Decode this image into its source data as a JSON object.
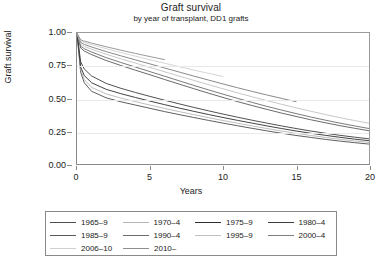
{
  "chart_data": {
    "type": "line",
    "title": "Graft survival",
    "subtitle": "by year of transplant, DD1 grafts",
    "xlabel": "Years",
    "ylabel": "Graft survival",
    "xlim": [
      0,
      20
    ],
    "ylim": [
      0,
      1
    ],
    "xticks": [
      0,
      5,
      10,
      15,
      20
    ],
    "xtick_labels": [
      "0",
      "5",
      "10",
      "15",
      "20"
    ],
    "yticks": [
      0.0,
      0.25,
      0.5,
      0.75,
      1.0
    ],
    "ytick_labels": [
      "0.00",
      "0.25",
      "0.50",
      "0.75",
      "1.00"
    ],
    "grid": "horizontal",
    "legend_position": "below",
    "series": [
      {
        "name": "1965–9",
        "color": "#4d4d4d",
        "x": [
          0,
          0.25,
          0.5,
          1,
          2,
          3,
          4,
          5,
          6,
          7,
          8,
          9,
          10,
          11,
          12,
          13,
          14,
          15,
          16,
          17,
          18,
          19,
          20
        ],
        "y": [
          1.0,
          0.7,
          0.62,
          0.555,
          0.505,
          0.475,
          0.45,
          0.425,
          0.4,
          0.377,
          0.355,
          0.333,
          0.312,
          0.292,
          0.272,
          0.253,
          0.235,
          0.218,
          0.203,
          0.188,
          0.175,
          0.163,
          0.152
        ]
      },
      {
        "name": "1970–4",
        "color": "#b5b5b5",
        "x": [
          0,
          0.25,
          0.5,
          1,
          2,
          3,
          4,
          5,
          6,
          7,
          8,
          9,
          10,
          11,
          12,
          13,
          14,
          15,
          16,
          17,
          18,
          19,
          20
        ],
        "y": [
          1.0,
          0.72,
          0.645,
          0.585,
          0.535,
          0.503,
          0.476,
          0.45,
          0.424,
          0.4,
          0.377,
          0.354,
          0.332,
          0.311,
          0.291,
          0.271,
          0.252,
          0.234,
          0.218,
          0.203,
          0.189,
          0.176,
          0.165
        ]
      },
      {
        "name": "1975–9",
        "color": "#2e2e2e",
        "x": [
          0,
          0.25,
          0.5,
          1,
          2,
          3,
          4,
          5,
          6,
          7,
          8,
          9,
          10,
          11,
          12,
          13,
          14,
          15,
          16,
          17,
          18,
          19,
          20
        ],
        "y": [
          1.0,
          0.74,
          0.675,
          0.62,
          0.57,
          0.537,
          0.508,
          0.48,
          0.453,
          0.427,
          0.402,
          0.378,
          0.355,
          0.333,
          0.312,
          0.291,
          0.271,
          0.252,
          0.235,
          0.219,
          0.204,
          0.19,
          0.178
        ]
      },
      {
        "name": "1980–4",
        "color": "#3d3d3d",
        "x": [
          0,
          0.25,
          0.5,
          1,
          2,
          3,
          4,
          5,
          6,
          7,
          8,
          9,
          10,
          11,
          12,
          13,
          14,
          15,
          16,
          17,
          18,
          19,
          20
        ],
        "y": [
          1.0,
          0.78,
          0.725,
          0.672,
          0.615,
          0.578,
          0.546,
          0.516,
          0.487,
          0.459,
          0.432,
          0.406,
          0.381,
          0.357,
          0.334,
          0.312,
          0.291,
          0.271,
          0.252,
          0.235,
          0.219,
          0.205,
          0.192
        ]
      },
      {
        "name": "1985–9",
        "color": "#595959",
        "x": [
          0,
          0.25,
          0.5,
          1,
          2,
          3,
          4,
          5,
          6,
          7,
          8,
          9,
          10,
          11,
          12,
          13,
          14,
          15,
          16,
          17,
          18,
          19,
          20
        ],
        "y": [
          1.0,
          0.885,
          0.862,
          0.835,
          0.79,
          0.752,
          0.716,
          0.681,
          0.645,
          0.61,
          0.575,
          0.541,
          0.508,
          0.476,
          0.446,
          0.417,
          0.389,
          0.363,
          0.338,
          0.315,
          0.293,
          0.273,
          0.254
        ]
      },
      {
        "name": "1990–4",
        "color": "#6b6b6b",
        "x": [
          0,
          0.25,
          0.5,
          1,
          2,
          3,
          4,
          5,
          6,
          7,
          8,
          9,
          10,
          11,
          12,
          13,
          14,
          15,
          16,
          17,
          18,
          19,
          20
        ],
        "y": [
          1.0,
          0.9,
          0.88,
          0.855,
          0.812,
          0.775,
          0.74,
          0.705,
          0.67,
          0.635,
          0.6,
          0.566,
          0.533,
          0.501,
          0.47,
          0.44,
          0.412,
          0.385,
          0.359,
          0.335,
          0.312,
          0.291,
          0.271
        ]
      },
      {
        "name": "1995–9",
        "color": "#c2c2c2",
        "x": [
          0,
          0.25,
          0.5,
          1,
          2,
          3,
          4,
          5,
          6,
          7,
          8,
          9,
          10,
          11,
          12,
          13,
          14,
          15,
          16,
          17,
          18,
          19,
          20
        ],
        "y": [
          1.0,
          0.915,
          0.898,
          0.876,
          0.838,
          0.803,
          0.77,
          0.737,
          0.704,
          0.671,
          0.638,
          0.606,
          0.574,
          0.543,
          0.513,
          0.484,
          0.456,
          0.429,
          0.403,
          0.378,
          0.354,
          0.332,
          0.311
        ]
      },
      {
        "name": "2000–4",
        "color": "#7d7d7d",
        "x": [
          0,
          0.25,
          0.5,
          1,
          2,
          3,
          4,
          5,
          6,
          7,
          8,
          9,
          10,
          11,
          12,
          13,
          14,
          15
        ],
        "y": [
          1.0,
          0.928,
          0.913,
          0.893,
          0.858,
          0.826,
          0.795,
          0.764,
          0.733,
          0.702,
          0.671,
          0.641,
          0.611,
          0.582,
          0.554,
          0.527,
          0.501,
          0.476
        ]
      },
      {
        "name": "2006–10",
        "color": "#cfcfcf",
        "x": [
          0,
          0.25,
          0.5,
          1,
          2,
          3,
          4,
          5,
          6,
          7,
          8,
          9,
          10
        ],
        "y": [
          1.0,
          0.94,
          0.928,
          0.911,
          0.88,
          0.851,
          0.823,
          0.796,
          0.769,
          0.743,
          0.717,
          0.692,
          0.668
        ]
      },
      {
        "name": "2010–",
        "color": "#8f8f8f",
        "x": [
          0,
          0.25,
          0.5,
          1,
          2,
          3,
          4,
          5,
          6
        ],
        "y": [
          1.0,
          0.948,
          0.938,
          0.923,
          0.895,
          0.869,
          0.844,
          0.82,
          0.797
        ]
      }
    ]
  }
}
